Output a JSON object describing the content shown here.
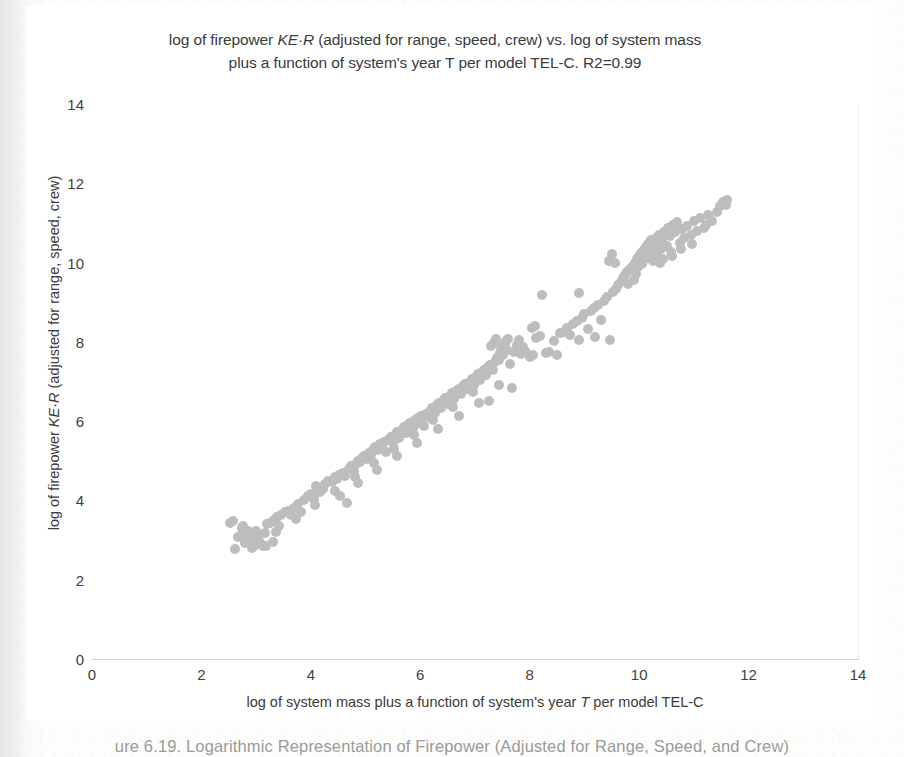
{
  "figure": {
    "caption": "ure 6.19.  Logarithmic Representation of Firepower (Adjusted for Range, Speed, and Crew)"
  },
  "chart_data": {
    "type": "scatter",
    "title_line1_pre": "log of firepower ",
    "title_line1_ital": "KE·R",
    "title_line1_post": "  (adjusted for range, speed, crew) vs. log  of system mass",
    "title_line2": "plus a function of system's year T per model TEL-C. R2=0.99",
    "title": "log of firepower KE·R  (adjusted for range, speed, crew) vs. log  of system mass plus a function of system's year T per model TEL-C. R2=0.99",
    "xlabel_pre": "log  of system mass plus  a function of system's year ",
    "xlabel_ital": "T",
    "xlabel_post": " per model TEL-C",
    "xlabel": "log  of system mass plus  a function of system's year T per model TEL-C",
    "ylabel_pre": "log of firepower ",
    "ylabel_ital": "KE·R",
    "ylabel_post": " (adjusted for range, speed, crew)",
    "ylabel": "log of firepower KE·R (adjusted for range, speed, crew)",
    "xlim": [
      0,
      14
    ],
    "ylim": [
      0,
      14
    ],
    "xticks": [
      0,
      2,
      4,
      6,
      8,
      10,
      12,
      14
    ],
    "yticks": [
      0,
      2,
      4,
      6,
      8,
      10,
      12,
      14
    ],
    "grid": true,
    "legend": null,
    "r_squared": 0.99,
    "point_color": "#bdbdbd",
    "point_size_px": 10,
    "series": [
      {
        "name": "weapon systems",
        "points": [
          [
            2.52,
            3.42
          ],
          [
            2.57,
            3.48
          ],
          [
            2.62,
            2.78
          ],
          [
            2.66,
            3.08
          ],
          [
            2.7,
            3.1
          ],
          [
            2.74,
            3.3
          ],
          [
            2.8,
            2.92
          ],
          [
            2.84,
            3.02
          ],
          [
            2.88,
            3.06
          ],
          [
            2.92,
            2.8
          ],
          [
            2.96,
            2.86
          ],
          [
            3.0,
            3.0
          ],
          [
            3.04,
            3.1
          ],
          [
            3.05,
            2.98
          ],
          [
            3.08,
            2.9
          ],
          [
            3.12,
            2.84
          ],
          [
            3.16,
            3.18
          ],
          [
            3.2,
            3.4
          ],
          [
            3.26,
            3.44
          ],
          [
            3.32,
            3.5
          ],
          [
            3.38,
            3.58
          ],
          [
            3.42,
            3.36
          ],
          [
            3.46,
            3.64
          ],
          [
            3.52,
            3.7
          ],
          [
            3.58,
            3.74
          ],
          [
            3.64,
            3.62
          ],
          [
            3.7,
            3.82
          ],
          [
            3.76,
            3.9
          ],
          [
            3.82,
            3.72
          ],
          [
            3.88,
            4.0
          ],
          [
            3.94,
            4.1
          ],
          [
            4.0,
            4.16
          ],
          [
            4.06,
            4.04
          ],
          [
            4.1,
            4.36
          ],
          [
            4.16,
            4.22
          ],
          [
            4.22,
            4.3
          ],
          [
            4.26,
            4.42
          ],
          [
            4.32,
            4.5
          ],
          [
            4.38,
            4.46
          ],
          [
            4.44,
            4.58
          ],
          [
            4.48,
            4.54
          ],
          [
            4.52,
            4.64
          ],
          [
            4.58,
            4.7
          ],
          [
            4.62,
            4.62
          ],
          [
            4.66,
            3.94
          ],
          [
            4.7,
            4.8
          ],
          [
            4.74,
            4.86
          ],
          [
            4.78,
            4.74
          ],
          [
            4.82,
            4.92
          ],
          [
            4.86,
            5.0
          ],
          [
            4.9,
            4.96
          ],
          [
            4.94,
            5.06
          ],
          [
            4.98,
            5.12
          ],
          [
            5.02,
            5.04
          ],
          [
            5.06,
            5.2
          ],
          [
            5.1,
            5.14
          ],
          [
            5.14,
            5.26
          ],
          [
            5.18,
            5.34
          ],
          [
            5.22,
            5.28
          ],
          [
            5.26,
            5.42
          ],
          [
            5.3,
            5.36
          ],
          [
            5.34,
            5.48
          ],
          [
            5.38,
            5.22
          ],
          [
            5.42,
            5.54
          ],
          [
            5.46,
            5.6
          ],
          [
            5.5,
            5.46
          ],
          [
            5.54,
            5.66
          ],
          [
            5.58,
            5.72
          ],
          [
            5.62,
            5.58
          ],
          [
            5.66,
            5.78
          ],
          [
            5.7,
            5.84
          ],
          [
            5.74,
            5.7
          ],
          [
            5.78,
            5.9
          ],
          [
            5.82,
            5.96
          ],
          [
            5.86,
            5.8
          ],
          [
            5.9,
            6.02
          ],
          [
            5.92,
            5.92
          ],
          [
            5.96,
            6.08
          ],
          [
            6.0,
            5.98
          ],
          [
            6.02,
            6.14
          ],
          [
            6.06,
            5.88
          ],
          [
            6.1,
            6.18
          ],
          [
            6.14,
            6.1
          ],
          [
            6.18,
            6.26
          ],
          [
            6.22,
            6.32
          ],
          [
            6.26,
            6.2
          ],
          [
            6.3,
            6.4
          ],
          [
            6.34,
            6.46
          ],
          [
            6.38,
            6.34
          ],
          [
            6.42,
            6.52
          ],
          [
            6.46,
            6.58
          ],
          [
            6.5,
            6.44
          ],
          [
            6.54,
            6.64
          ],
          [
            6.58,
            6.7
          ],
          [
            6.62,
            6.56
          ],
          [
            6.66,
            6.76
          ],
          [
            6.7,
            6.82
          ],
          [
            6.74,
            6.68
          ],
          [
            6.78,
            6.88
          ],
          [
            6.82,
            6.94
          ],
          [
            6.86,
            6.8
          ],
          [
            6.9,
            7.0
          ],
          [
            6.94,
            7.06
          ],
          [
            6.98,
            6.92
          ],
          [
            7.02,
            7.12
          ],
          [
            7.06,
            7.18
          ],
          [
            7.1,
            7.04
          ],
          [
            7.12,
            7.24
          ],
          [
            7.16,
            7.3
          ],
          [
            7.2,
            7.16
          ],
          [
            7.24,
            7.36
          ],
          [
            7.26,
            6.52
          ],
          [
            7.28,
            7.42
          ],
          [
            7.32,
            7.28
          ],
          [
            7.36,
            7.48
          ],
          [
            7.4,
            7.6
          ],
          [
            7.44,
            7.54
          ],
          [
            7.46,
            7.72
          ],
          [
            7.48,
            7.88
          ],
          [
            7.52,
            7.66
          ],
          [
            7.54,
            7.96
          ],
          [
            7.56,
            8.02
          ],
          [
            7.58,
            7.8
          ],
          [
            7.6,
            8.08
          ],
          [
            7.64,
            7.44
          ],
          [
            7.68,
            6.84
          ],
          [
            7.72,
            7.74
          ],
          [
            7.76,
            7.92
          ],
          [
            7.8,
            8.04
          ],
          [
            7.84,
            7.7
          ],
          [
            7.88,
            7.86
          ],
          [
            7.92,
            7.78
          ],
          [
            8.0,
            7.62
          ],
          [
            8.06,
            7.66
          ],
          [
            8.12,
            8.1
          ],
          [
            8.18,
            8.16
          ],
          [
            8.22,
            9.18
          ],
          [
            8.3,
            7.72
          ],
          [
            8.36,
            7.74
          ],
          [
            8.44,
            8.02
          ],
          [
            8.5,
            7.66
          ],
          [
            8.56,
            8.22
          ],
          [
            8.62,
            8.26
          ],
          [
            8.68,
            8.34
          ],
          [
            8.74,
            8.18
          ],
          [
            8.8,
            8.44
          ],
          [
            8.86,
            8.52
          ],
          [
            8.9,
            9.22
          ],
          [
            8.96,
            8.6
          ],
          [
            9.0,
            8.7
          ],
          [
            9.06,
            8.32
          ],
          [
            9.12,
            8.78
          ],
          [
            9.18,
            8.86
          ],
          [
            9.24,
            8.94
          ],
          [
            9.3,
            8.56
          ],
          [
            9.36,
            9.04
          ],
          [
            9.42,
            9.12
          ],
          [
            9.46,
            8.04
          ],
          [
            9.52,
            9.26
          ],
          [
            9.58,
            9.34
          ],
          [
            9.62,
            9.44
          ],
          [
            9.66,
            9.52
          ],
          [
            9.7,
            9.6
          ],
          [
            9.74,
            9.68
          ],
          [
            9.78,
            9.76
          ],
          [
            9.8,
            9.46
          ],
          [
            9.84,
            9.84
          ],
          [
            9.88,
            9.92
          ],
          [
            9.9,
            9.56
          ],
          [
            9.92,
            10.0
          ],
          [
            9.94,
            9.72
          ],
          [
            9.96,
            10.08
          ],
          [
            9.98,
            9.88
          ],
          [
            10.0,
            10.16
          ],
          [
            10.02,
            10.02
          ],
          [
            10.04,
            10.24
          ],
          [
            10.06,
            9.96
          ],
          [
            10.08,
            10.32
          ],
          [
            10.1,
            10.1
          ],
          [
            10.12,
            10.4
          ],
          [
            10.14,
            10.2
          ],
          [
            10.16,
            10.48
          ],
          [
            10.18,
            10.28
          ],
          [
            10.2,
            10.12
          ],
          [
            10.22,
            10.56
          ],
          [
            10.24,
            10.36
          ],
          [
            10.26,
            10.04
          ],
          [
            10.28,
            10.44
          ],
          [
            10.3,
            10.62
          ],
          [
            10.32,
            10.22
          ],
          [
            10.34,
            10.52
          ],
          [
            10.36,
            10.7
          ],
          [
            10.38,
            10.0
          ],
          [
            10.4,
            10.34
          ],
          [
            10.42,
            10.6
          ],
          [
            10.46,
            10.78
          ],
          [
            10.5,
            10.42
          ],
          [
            10.52,
            10.86
          ],
          [
            10.56,
            10.68
          ],
          [
            10.58,
            10.26
          ],
          [
            10.62,
            10.94
          ],
          [
            10.66,
            10.76
          ],
          [
            10.7,
            11.02
          ],
          [
            10.74,
            10.5
          ],
          [
            10.78,
            10.84
          ],
          [
            10.82,
            10.62
          ],
          [
            10.88,
            10.92
          ],
          [
            10.94,
            10.7
          ],
          [
            11.0,
            11.04
          ],
          [
            11.06,
            10.8
          ],
          [
            11.12,
            11.12
          ],
          [
            11.18,
            10.88
          ],
          [
            11.26,
            11.2
          ],
          [
            11.34,
            11.06
          ],
          [
            11.42,
            11.28
          ],
          [
            11.48,
            11.42
          ],
          [
            11.54,
            11.52
          ],
          [
            11.58,
            11.46
          ],
          [
            11.6,
            11.58
          ],
          [
            9.44,
            10.04
          ],
          [
            9.5,
            10.22
          ],
          [
            9.56,
            9.98
          ],
          [
            10.44,
            10.1
          ],
          [
            10.6,
            10.16
          ],
          [
            10.76,
            10.34
          ],
          [
            10.96,
            10.46
          ],
          [
            11.22,
            10.96
          ],
          [
            8.04,
            8.36
          ],
          [
            8.1,
            8.4
          ],
          [
            7.3,
            7.9
          ],
          [
            7.34,
            7.98
          ],
          [
            7.38,
            8.06
          ],
          [
            6.96,
            6.74
          ],
          [
            6.6,
            6.36
          ],
          [
            6.24,
            6.02
          ],
          [
            5.88,
            5.66
          ],
          [
            5.52,
            5.3
          ],
          [
            5.16,
            4.94
          ],
          [
            4.8,
            4.58
          ],
          [
            4.44,
            4.24
          ],
          [
            4.08,
            3.88
          ],
          [
            3.72,
            3.52
          ],
          [
            3.36,
            3.2
          ],
          [
            3.0,
            3.22
          ],
          [
            2.76,
            3.36
          ],
          [
            2.86,
            3.24
          ],
          [
            3.18,
            2.86
          ],
          [
            3.3,
            2.94
          ],
          [
            4.54,
            4.12
          ],
          [
            4.86,
            4.44
          ],
          [
            5.2,
            4.78
          ],
          [
            5.58,
            5.12
          ],
          [
            5.94,
            5.46
          ],
          [
            6.32,
            5.8
          ],
          [
            6.7,
            6.12
          ],
          [
            7.08,
            6.46
          ],
          [
            7.44,
            6.9
          ],
          [
            8.9,
            8.04
          ],
          [
            9.2,
            8.12
          ]
        ]
      }
    ]
  }
}
